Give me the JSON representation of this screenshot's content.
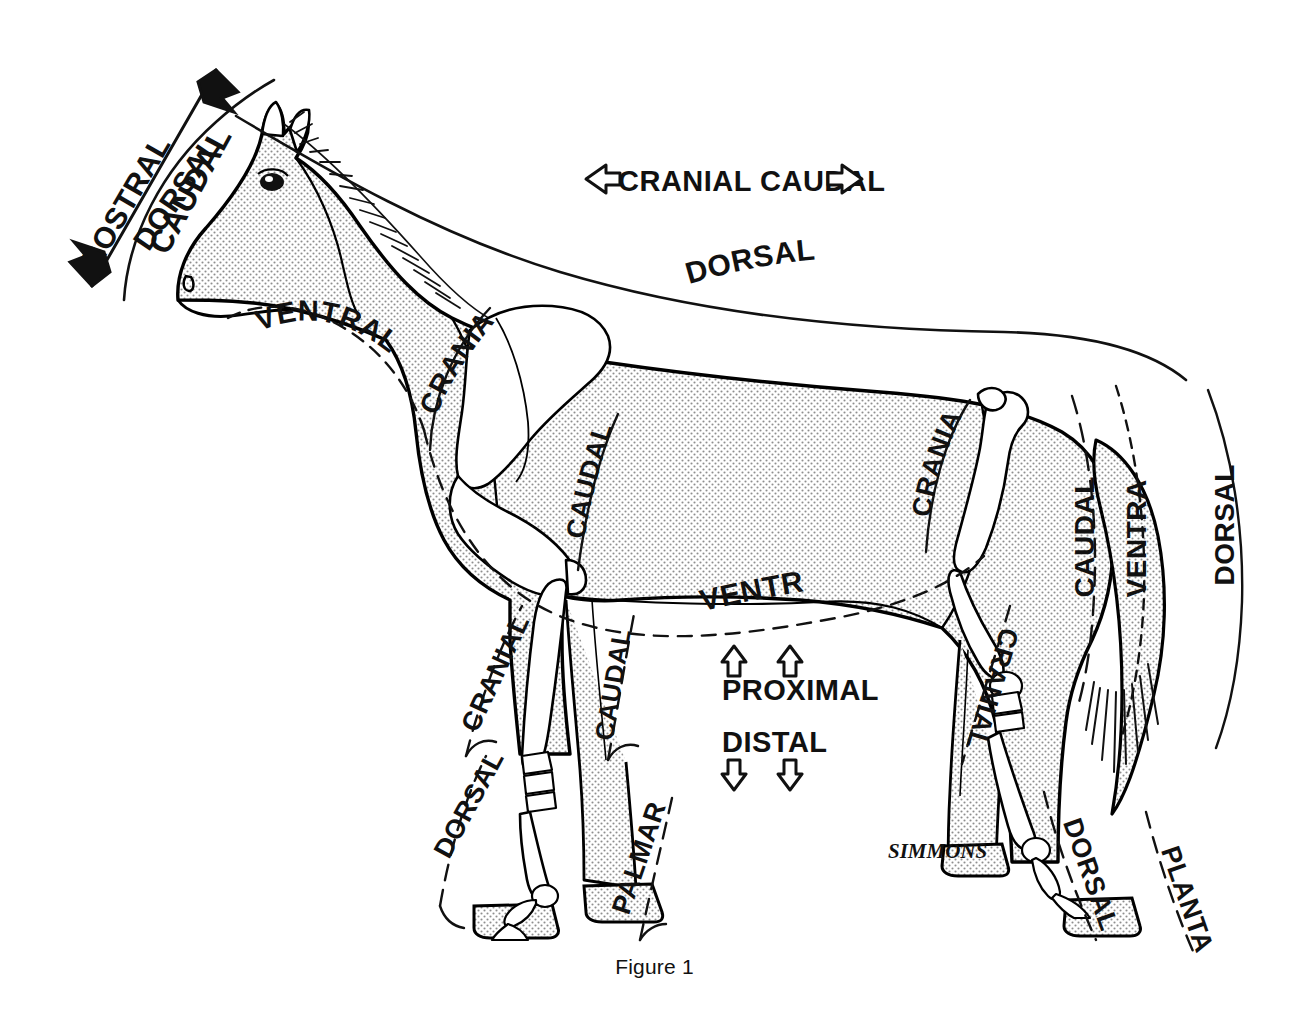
{
  "figure": {
    "caption": "Figure 1",
    "artist_signature": "SIMMONS"
  },
  "colors": {
    "ink": "#111111",
    "outline": "#000000",
    "body_fill": "#e2e2e2",
    "bone_fill": "#ffffff",
    "paper": "#ffffff"
  },
  "legend_arrows": {
    "cranial": {
      "label": "CRANIAL",
      "glyph": "⇦",
      "direction": "left"
    },
    "caudal": {
      "label": "CAUDAL",
      "glyph": "⇨",
      "direction": "right"
    },
    "proximal": {
      "label": "PROXIMAL",
      "glyph": "⇧",
      "direction": "up",
      "arrow_count": 2
    },
    "distal": {
      "label": "DISTAL",
      "glyph": "⇩",
      "direction": "down",
      "arrow_count": 2
    }
  },
  "labels": {
    "head_rostral": "ROSTRAL",
    "head_caudal": "CAUDAL",
    "head_dorsal": "DORSAL",
    "neck_ventral": "VENTRAL",
    "trunk_dorsal": "DORSAL",
    "trunk_ventral": "VENTRAL",
    "forelimb_cranial_upper": "CRANIAL",
    "forelimb_caudal_upper": "CAUDAL",
    "forelimb_cranial_lower": "CRANIAL",
    "forelimb_caudal_lower": "CAUDAL",
    "forelimb_dorsal": "DORSAL",
    "forelimb_palmar": "PALMAR",
    "hindlimb_cranial_upper": "CRANIAL",
    "hindlimb_cranial_lower": "CRANIAL",
    "hindlimb_dorsal": "DORSAL",
    "hindlimb_plantar": "PLANTAR",
    "tail_caudal": "CAUDAL",
    "tail_ventral": "VENTRAL",
    "tail_dorsal": "DORSAL"
  },
  "label_list": [
    {
      "id": "head-rostral",
      "text": "ROSTRAL",
      "region": "head",
      "axis": "rostral"
    },
    {
      "id": "head-caudal",
      "text": "CAUDAL",
      "region": "head",
      "axis": "caudal"
    },
    {
      "id": "head-dorsal",
      "text": "DORSAL",
      "region": "head",
      "axis": "dorsal"
    },
    {
      "id": "neck-ventral",
      "text": "VENTRAL",
      "region": "neck",
      "axis": "ventral"
    },
    {
      "id": "trunk-dorsal",
      "text": "DORSAL",
      "region": "trunk",
      "axis": "dorsal"
    },
    {
      "id": "trunk-ventral",
      "text": "VENTRAL",
      "region": "trunk",
      "axis": "ventral"
    },
    {
      "id": "forelimb-cranial-up",
      "text": "CRANIAL",
      "region": "forelimb",
      "axis": "cranial"
    },
    {
      "id": "forelimb-caudal-up",
      "text": "CAUDAL",
      "region": "forelimb",
      "axis": "caudal"
    },
    {
      "id": "forelimb-cranial-lo",
      "text": "CRANIAL",
      "region": "forelimb",
      "axis": "cranial"
    },
    {
      "id": "forelimb-caudal-lo",
      "text": "CAUDAL",
      "region": "forelimb",
      "axis": "caudal"
    },
    {
      "id": "forelimb-dorsal",
      "text": "DORSAL",
      "region": "forefoot",
      "axis": "dorsal"
    },
    {
      "id": "forelimb-palmar",
      "text": "PALMAR",
      "region": "forefoot",
      "axis": "palmar"
    },
    {
      "id": "hindlimb-cranial-up",
      "text": "CRANIAL",
      "region": "hindlimb",
      "axis": "cranial"
    },
    {
      "id": "hindlimb-cranial-lo",
      "text": "CRANIAL",
      "region": "hindlimb",
      "axis": "cranial"
    },
    {
      "id": "hindlimb-dorsal",
      "text": "DORSAL",
      "region": "hindfoot",
      "axis": "dorsal"
    },
    {
      "id": "hindlimb-plantar",
      "text": "PLANTAR",
      "region": "hindfoot",
      "axis": "plantar"
    },
    {
      "id": "tail-caudal",
      "text": "CAUDAL",
      "region": "tail",
      "axis": "caudal"
    },
    {
      "id": "tail-ventral",
      "text": "VENTRAL",
      "region": "tail",
      "axis": "ventral"
    },
    {
      "id": "tail-dorsal",
      "text": "DORSAL",
      "region": "tail",
      "axis": "dorsal"
    }
  ]
}
